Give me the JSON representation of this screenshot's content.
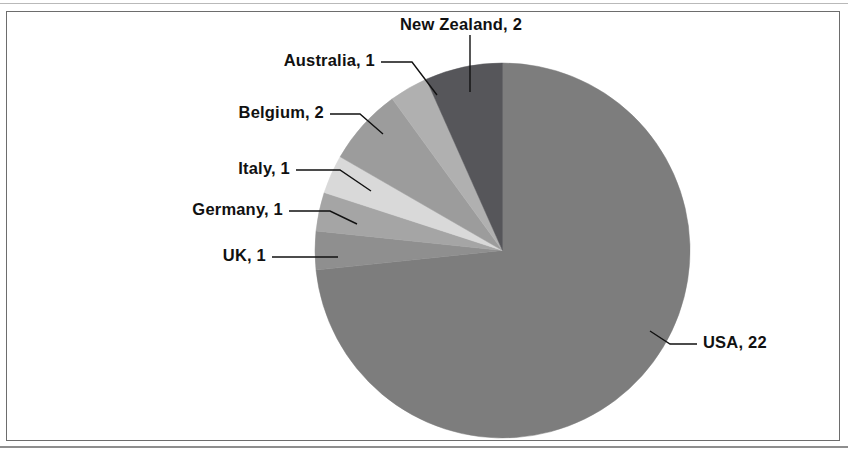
{
  "figure": {
    "frame_color": "#6d6d6d",
    "background": "#ffffff"
  },
  "chart_data": {
    "type": "pie",
    "title": "",
    "total": 30,
    "start_angle_deg": 0,
    "direction": "clockwise",
    "legend_position": "none",
    "labels_style": "callout labels with leader lines",
    "categories": [
      "USA",
      "UK",
      "Germany",
      "Italy",
      "Belgium",
      "Australia",
      "New Zealand"
    ],
    "values": [
      22,
      1,
      1,
      1,
      2,
      1,
      2
    ],
    "labels": [
      "USA, 22",
      "UK, 1",
      "Germany, 1",
      "Italy, 1",
      "Belgium, 2",
      "Australia, 1",
      "New Zealand, 2"
    ],
    "colors": [
      "#7d7d7d",
      "#8f8f8f",
      "#a5a5a5",
      "#d9d9d9",
      "#9c9c9c",
      "#b0b0b0",
      "#56565a"
    ],
    "slices": [
      {
        "name": "USA",
        "label": "USA, 22",
        "value": 22,
        "color": "#7d7d7d",
        "start_deg": 0,
        "end_deg": 264
      },
      {
        "name": "UK",
        "label": "UK, 1",
        "value": 1,
        "color": "#8f8f8f",
        "start_deg": 264,
        "end_deg": 276
      },
      {
        "name": "Germany",
        "label": "Germany, 1",
        "value": 1,
        "color": "#a5a5a5",
        "start_deg": 276,
        "end_deg": 288
      },
      {
        "name": "Italy",
        "label": "Italy, 1",
        "value": 1,
        "color": "#d9d9d9",
        "start_deg": 288,
        "end_deg": 300
      },
      {
        "name": "Belgium",
        "label": "Belgium, 2",
        "value": 2,
        "color": "#9c9c9c",
        "start_deg": 300,
        "end_deg": 324
      },
      {
        "name": "Australia",
        "label": "Australia, 1",
        "value": 1,
        "color": "#b0b0b0",
        "start_deg": 324,
        "end_deg": 336
      },
      {
        "name": "New Zealand",
        "label": "New Zealand, 2",
        "value": 2,
        "color": "#56565a",
        "start_deg": 336,
        "end_deg": 360
      }
    ]
  },
  "labels": {
    "new_zealand": "New Zealand, 2",
    "australia": "Australia, 1",
    "belgium": "Belgium, 2",
    "italy": "Italy, 1",
    "germany": "Germany, 1",
    "uk": "UK, 1",
    "usa": "USA, 22"
  }
}
